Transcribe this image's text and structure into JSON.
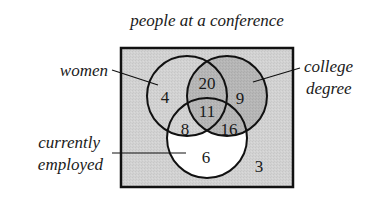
{
  "title": "people at a conference",
  "sets": {
    "women": {
      "label": "women"
    },
    "college": {
      "label_line1": "college",
      "label_line2": "degree"
    },
    "employed": {
      "label_line1": "currently",
      "label_line2": "employed"
    }
  },
  "regions": {
    "women_only": "4",
    "women_college": "20",
    "college_only": "9",
    "all_three": "11",
    "women_employed": "8",
    "college_employed": "16",
    "employed_only": "6",
    "none": "3"
  },
  "colors": {
    "background_box": "#d4d4d4",
    "dark_shade": "#b8b8b8",
    "white_region": "#ffffff",
    "stroke": "#111111"
  }
}
